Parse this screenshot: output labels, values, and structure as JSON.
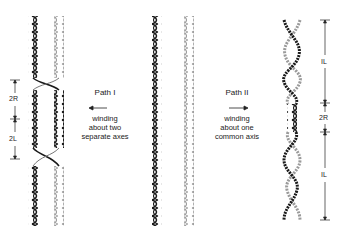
{
  "diagram": {
    "left_panel": {
      "dimensions": [
        {
          "label": "2R",
          "y_top": 80,
          "y_bottom": 119
        },
        {
          "label": "2L",
          "y_top": 119,
          "y_bottom": 159
        }
      ]
    },
    "path_one": {
      "title": "Path I",
      "arrow_direction": "left",
      "description_lines": [
        "winding",
        "about two",
        "separate axes"
      ]
    },
    "path_two": {
      "title": "Path II",
      "arrow_direction": "right",
      "description_lines": [
        "winding",
        "about one",
        "common axis"
      ]
    },
    "right_panel": {
      "dimensions": [
        {
          "label": "IL",
          "y_top": 20,
          "y_bottom": 103
        },
        {
          "label": "2R",
          "y_top": 103,
          "y_bottom": 132
        },
        {
          "label": "IL",
          "y_top": 132,
          "y_bottom": 220
        }
      ]
    },
    "colors": {
      "dark_strand": "#1a1a1a",
      "light_strand": "#9a9a9a",
      "ink": "#222222"
    }
  }
}
